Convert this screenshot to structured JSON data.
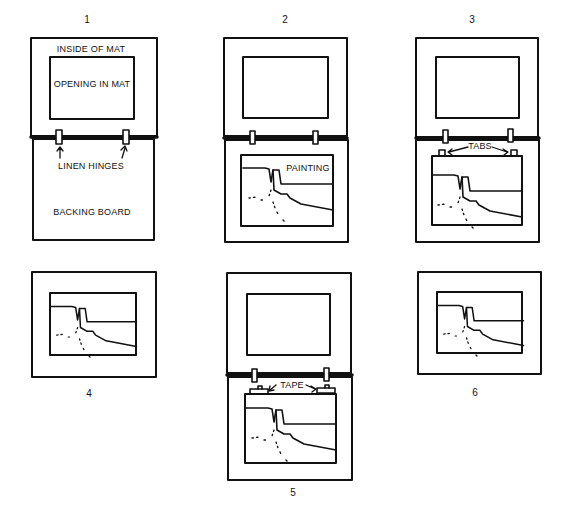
{
  "figure": {
    "steps": [
      {
        "number": "1",
        "labels": {
          "inside_of_mat": "INSIDE OF MAT",
          "opening_in_mat": "OPENING IN MAT",
          "linen_hinges": "LINEN HINGES",
          "backing_board": "BACKING BOARD"
        }
      },
      {
        "number": "2",
        "labels": {
          "painting": "PAINTING"
        }
      },
      {
        "number": "3",
        "labels": {
          "tabs": "TABS"
        }
      },
      {
        "number": "4",
        "labels": {}
      },
      {
        "number": "5",
        "labels": {
          "tape": "TAPE"
        }
      },
      {
        "number": "6",
        "labels": {}
      }
    ]
  },
  "colors": {
    "ink": "#111111",
    "paper": "#ffffff"
  }
}
